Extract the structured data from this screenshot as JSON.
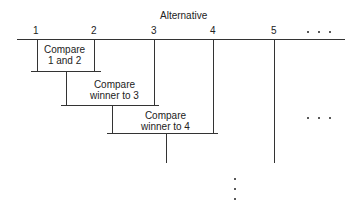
{
  "diagram": {
    "title": "Alternative",
    "alternatives": [
      "1",
      "2",
      "3",
      "4",
      "5"
    ],
    "ellipsis_top": "• • •",
    "steps": [
      {
        "line1": "Compare",
        "line2": "1 and 2"
      },
      {
        "line1": "Compare",
        "line2": "winner to 3"
      },
      {
        "line1": "Compare",
        "line2": "winner to 4"
      }
    ]
  }
}
